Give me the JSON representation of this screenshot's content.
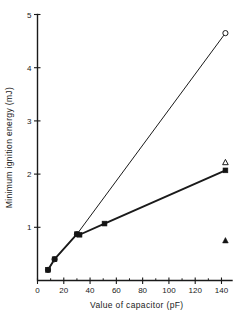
{
  "chart_data": {
    "type": "scatter",
    "title": "",
    "xlabel": "Value of capacitor (pF)",
    "ylabel": "Minimum ignition energy (mJ)",
    "xlim": [
      0,
      148
    ],
    "ylim": [
      0,
      5
    ],
    "xticks": [
      0,
      20,
      40,
      60,
      80,
      100,
      120,
      140
    ],
    "xticklabels": [
      "0",
      "20",
      "40",
      "60",
      "80",
      "100",
      "120",
      "140"
    ],
    "yticks": [
      1,
      2,
      3,
      4,
      5
    ],
    "yticklabels": [
      "1",
      "2",
      "3",
      "4",
      "5"
    ],
    "xminorticks": [
      10,
      30,
      50,
      70,
      90,
      110,
      130
    ],
    "grid": false,
    "legend": "none",
    "series": [
      {
        "name": "upper-branch",
        "marker": "open-circle",
        "line": true,
        "points": [
          {
            "x": 8,
            "y": 0.2
          },
          {
            "x": 13,
            "y": 0.4
          },
          {
            "x": 30,
            "y": 0.87
          },
          {
            "x": 143,
            "y": 4.65
          }
        ]
      },
      {
        "name": "lower-branch",
        "marker": "filled-square",
        "line": true,
        "points": [
          {
            "x": 8,
            "y": 0.2
          },
          {
            "x": 13,
            "y": 0.4
          },
          {
            "x": 30,
            "y": 0.87
          },
          {
            "x": 32,
            "y": 0.86
          },
          {
            "x": 51,
            "y": 1.07
          },
          {
            "x": 143,
            "y": 2.07
          }
        ]
      },
      {
        "name": "open-triangle-points",
        "marker": "open-triangle",
        "line": false,
        "points": [
          {
            "x": 143,
            "y": 2.22
          }
        ]
      },
      {
        "name": "filled-triangle-points",
        "marker": "filled-triangle",
        "line": false,
        "points": [
          {
            "x": 143,
            "y": 0.75
          }
        ]
      }
    ]
  },
  "colors": {
    "ink": "#1a1a1a",
    "background": "#ffffff",
    "marker_fill": "#141414"
  }
}
